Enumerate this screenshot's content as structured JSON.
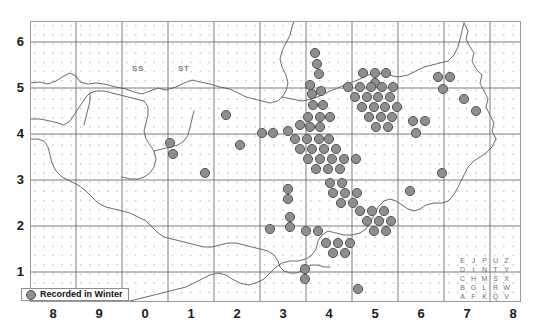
{
  "figure": {
    "title": "",
    "type": "species distribution dot map"
  },
  "axes": {
    "y_ticks": [
      "6",
      "5",
      "4",
      "3",
      "2",
      "1"
    ],
    "x_ticks": [
      "8",
      "9",
      "0",
      "1",
      "2",
      "3",
      "4",
      "5",
      "6",
      "7",
      "8"
    ],
    "xlabel": "",
    "ylabel": ""
  },
  "legend": {
    "label": "Recorded in Winter",
    "marker_color": "#8e8e8e",
    "marker_edge_color": "#4d4d4d",
    "marker_shape": "circle"
  },
  "square_labels": [
    {
      "text": "SS",
      "x": 132,
      "y": 64
    },
    {
      "text": "ST",
      "x": 178,
      "y": 64
    }
  ],
  "letter_key": {
    "rows": [
      [
        "E",
        "J",
        "P",
        "U",
        "Z"
      ],
      [
        "D",
        "I",
        "N",
        "T",
        "Y"
      ],
      [
        "C",
        "H",
        "M",
        "S",
        "X"
      ],
      [
        "B",
        "G",
        "L",
        "R",
        "W"
      ],
      [
        "A",
        "F",
        "K",
        "Q",
        "V"
      ]
    ]
  },
  "colors": {
    "frame": "#9a9a9a",
    "gridline": "#6e6e6e",
    "coastline": "#5a5a5a",
    "dot_matrix": "#c8c8d2",
    "record_fill": "#8e8e8e",
    "record_stroke": "#4a4a4a",
    "background": "#ffffff"
  },
  "chart_data": {
    "type": "scatter",
    "title": "",
    "xlabel": "",
    "ylabel": "",
    "xlim": [
      0,
      491
    ],
    "ylim": [
      0,
      281
    ],
    "grid": true,
    "legend_position": "bottom-left",
    "series": [
      {
        "name": "Recorded in Winter",
        "marker": "filled-circle",
        "color": "#8e8e8e",
        "points": [
          [
            285,
            32
          ],
          [
            287,
            43
          ],
          [
            289,
            53
          ],
          [
            280,
            64
          ],
          [
            282,
            73
          ],
          [
            291,
            70
          ],
          [
            283,
            84
          ],
          [
            293,
            84
          ],
          [
            278,
            96
          ],
          [
            290,
            96
          ],
          [
            300,
            96
          ],
          [
            270,
            104
          ],
          [
            280,
            106
          ],
          [
            290,
            106
          ],
          [
            258,
            110
          ],
          [
            265,
            118
          ],
          [
            277,
            118
          ],
          [
            289,
            118
          ],
          [
            299,
            118
          ],
          [
            270,
            128
          ],
          [
            282,
            128
          ],
          [
            294,
            128
          ],
          [
            306,
            128
          ],
          [
            278,
            138
          ],
          [
            290,
            138
          ],
          [
            302,
            138
          ],
          [
            314,
            138
          ],
          [
            326,
            138
          ],
          [
            286,
            148
          ],
          [
            298,
            148
          ],
          [
            310,
            148
          ],
          [
            232,
            112
          ],
          [
            243,
            112
          ],
          [
            210,
            124
          ],
          [
            333,
            52
          ],
          [
            345,
            52
          ],
          [
            356,
            52
          ],
          [
            345,
            62
          ],
          [
            318,
            66
          ],
          [
            330,
            66
          ],
          [
            341,
            66
          ],
          [
            352,
            66
          ],
          [
            363,
            66
          ],
          [
            325,
            76
          ],
          [
            337,
            76
          ],
          [
            348,
            76
          ],
          [
            360,
            76
          ],
          [
            332,
            86
          ],
          [
            344,
            86
          ],
          [
            355,
            86
          ],
          [
            367,
            86
          ],
          [
            339,
            96
          ],
          [
            351,
            96
          ],
          [
            362,
            96
          ],
          [
            346,
            106
          ],
          [
            358,
            106
          ],
          [
            383,
            100
          ],
          [
            395,
            100
          ],
          [
            386,
            112
          ],
          [
            408,
            56
          ],
          [
            420,
            56
          ],
          [
            413,
            68
          ],
          [
            434,
            78
          ],
          [
            446,
            90
          ],
          [
            140,
            122
          ],
          [
            143,
            133
          ],
          [
            175,
            152
          ],
          [
            196,
            94
          ],
          [
            258,
            168
          ],
          [
            258,
            178
          ],
          [
            300,
            162
          ],
          [
            312,
            162
          ],
          [
            303,
            172
          ],
          [
            315,
            172
          ],
          [
            327,
            172
          ],
          [
            311,
            182
          ],
          [
            323,
            182
          ],
          [
            330,
            190
          ],
          [
            342,
            190
          ],
          [
            354,
            190
          ],
          [
            337,
            200
          ],
          [
            349,
            200
          ],
          [
            361,
            200
          ],
          [
            344,
            210
          ],
          [
            356,
            210
          ],
          [
            260,
            196
          ],
          [
            260,
            206
          ],
          [
            276,
            210
          ],
          [
            288,
            210
          ],
          [
            296,
            222
          ],
          [
            308,
            222
          ],
          [
            320,
            222
          ],
          [
            303,
            232
          ],
          [
            315,
            232
          ],
          [
            240,
            208
          ],
          [
            380,
            170
          ],
          [
            412,
            152
          ],
          [
            275,
            248
          ],
          [
            275,
            258
          ],
          [
            328,
            268
          ],
          [
            310,
            286
          ]
        ]
      }
    ]
  }
}
